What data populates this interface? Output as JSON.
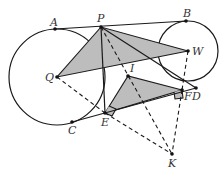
{
  "diagram": {
    "type": "geometry",
    "points": {
      "A": {
        "label": "A",
        "x": 55,
        "y": 29
      },
      "P": {
        "label": "P",
        "x": 101,
        "y": 27
      },
      "B": {
        "label": "B",
        "x": 186,
        "y": 21
      },
      "Q": {
        "label": "Q",
        "x": 57,
        "y": 77
      },
      "W": {
        "label": "W",
        "x": 188,
        "y": 51
      },
      "I": {
        "label": "I",
        "x": 128,
        "y": 76
      },
      "E": {
        "label": "E",
        "x": 105,
        "y": 113
      },
      "F": {
        "label": "F",
        "x": 182,
        "y": 90
      },
      "D": {
        "label": "D",
        "x": 196,
        "y": 88
      },
      "C": {
        "label": "C",
        "x": 72,
        "y": 122
      },
      "K": {
        "label": "K",
        "x": 172,
        "y": 154
      }
    },
    "circles": [
      {
        "name": "circle-Q",
        "center": "Q",
        "r": 48
      },
      {
        "name": "circle-W",
        "center": "W",
        "r": 30
      }
    ],
    "shaded_triangles": [
      [
        "P",
        "Q",
        "W"
      ],
      [
        "E",
        "I",
        "F"
      ]
    ],
    "solid_segments": [
      [
        "A",
        "B"
      ],
      [
        "P",
        "D"
      ],
      [
        "P",
        "E"
      ],
      [
        "C",
        "D"
      ]
    ],
    "dashed_segments": [
      [
        "P",
        "K"
      ],
      [
        "P",
        "I"
      ],
      [
        "Q",
        "E"
      ],
      [
        "E",
        "K"
      ],
      [
        "W",
        "F"
      ],
      [
        "F",
        "K"
      ]
    ],
    "right_angle_marks": [
      "E",
      "F"
    ]
  }
}
